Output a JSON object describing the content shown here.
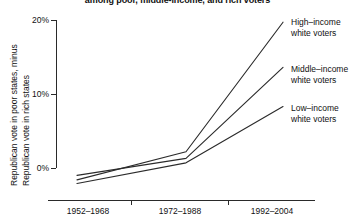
{
  "chart_data": {
    "type": "line",
    "title": "among poor, middle-income, and rich voters",
    "xlabel": "",
    "ylabel_line1": "Republican vote in poor states, minus",
    "ylabel_line2": "Republican vote in rich states",
    "categories": [
      "1952–1968",
      "1972–1988",
      "1992–2004"
    ],
    "ylim": [
      -2,
      20
    ],
    "yticks": [
      0,
      10,
      20
    ],
    "ytick_labels": [
      "0%",
      "10%",
      "20%"
    ],
    "grid": false,
    "legend_position": "right-inline",
    "series": [
      {
        "name": "High–income\nwhite voters",
        "label_line1": "High–income",
        "label_line2": "white voters",
        "values": [
          -1.6,
          2.2,
          19.7
        ]
      },
      {
        "name": "Middle–income\nwhite voters",
        "label_line1": "Middle–income",
        "label_line2": "white voters",
        "values": [
          -1.0,
          1.3,
          13.6
        ]
      },
      {
        "name": "Low–income\nwhite voters",
        "label_line1": "Low–income",
        "label_line2": "white voters",
        "values": [
          -2.1,
          0.7,
          8.3
        ]
      }
    ],
    "colors": {
      "line": "#2b2b2b",
      "axis": "#2a2a2a",
      "text": "#111111"
    }
  },
  "axis": {
    "ytick_0": "0%",
    "ytick_1": "10%",
    "ytick_2": "20%",
    "xtick_0": "1952–1968",
    "xtick_1": "1972–1988",
    "xtick_2": "1992–2004"
  },
  "labels": {
    "high_1": "High–income",
    "high_2": "white voters",
    "mid_1": "Middle–income",
    "mid_2": "white voters",
    "low_1": "Low–income",
    "low_2": "white voters"
  }
}
